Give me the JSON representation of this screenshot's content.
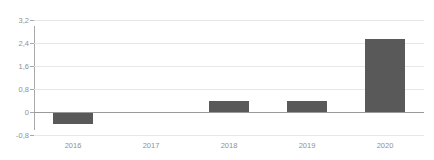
{
  "chart_data": {
    "type": "bar",
    "title": "",
    "xlabel": "",
    "ylabel": "",
    "categories": [
      "2016",
      "2017",
      "2018",
      "2019",
      "2020"
    ],
    "values": [
      -0.4,
      -0.02,
      0.4,
      0.4,
      2.55
    ],
    "series": [
      {
        "name": "value",
        "values": [
          -0.4,
          -0.02,
          0.4,
          0.4,
          2.55
        ]
      }
    ],
    "ylim": [
      -0.8,
      3.2
    ],
    "yticks": [
      -0.8,
      0,
      0.8,
      1.6,
      2.4,
      3.2
    ],
    "ytick_labels": [
      "-0,8",
      "0",
      "0,8",
      "1,6",
      "2,4",
      "3,2"
    ],
    "grid": true,
    "grid_axis": "y",
    "legend": false,
    "legend_position": "none",
    "decimal_separator": ",",
    "bar_color": "#595959",
    "gridline_color": "#e8e8e8",
    "axis_color": "#a8a8a8",
    "zero_line_color": "#9a9a9a",
    "tick_label_color": "#909090",
    "background_color": "#ffffff"
  }
}
